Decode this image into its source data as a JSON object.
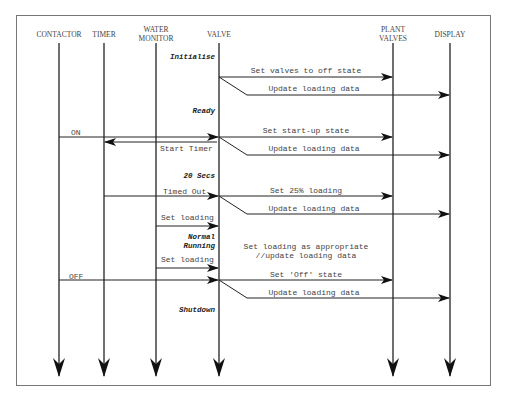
{
  "diagram": {
    "type": "sequence-diagram",
    "lifelines": [
      {
        "id": "contactor",
        "label": "CONTACTOR",
        "x": 59
      },
      {
        "id": "timer",
        "label": "TIMER",
        "x": 104
      },
      {
        "id": "water_monitor",
        "label": "WATER\nMONITOR",
        "label_line1": "WATER",
        "label_line2": "MONITOR",
        "x": 156
      },
      {
        "id": "valve",
        "label": "VALVE",
        "x": 219
      },
      {
        "id": "plant_valves",
        "label": "PLANT\nVALVES",
        "label_line1": "PLANT",
        "label_line2": "VALVES",
        "x": 393
      },
      {
        "id": "display",
        "label": "DISPLAY",
        "x": 450
      }
    ],
    "states": [
      {
        "label": "Initialise"
      },
      {
        "label": "Ready"
      },
      {
        "label": "20 Secs"
      },
      {
        "label": "Normal",
        "label2": "Running"
      },
      {
        "label": "Shutdown"
      }
    ],
    "messages": [
      {
        "label": "Set valves to off state",
        "from": "VALVE",
        "to": "PLANT VALVES"
      },
      {
        "label": "Update loading data",
        "from": "VALVE",
        "to": "DISPLAY"
      },
      {
        "label": "ON",
        "from": "CONTACTOR",
        "to": "VALVE"
      },
      {
        "label": "Set start-up state",
        "from": "VALVE",
        "to": "PLANT VALVES"
      },
      {
        "label": "Start Timer",
        "from": "VALVE",
        "to": "TIMER"
      },
      {
        "label": "Update loading data",
        "from": "VALVE",
        "to": "DISPLAY"
      },
      {
        "label": "Timed Out",
        "from": "TIMER",
        "to": "VALVE"
      },
      {
        "label": "Set 25% loading",
        "from": "VALVE",
        "to": "PLANT VALVES"
      },
      {
        "label": "Update loading data",
        "from": "VALVE",
        "to": "DISPLAY"
      },
      {
        "label": "Set loading",
        "from": "WATER MONITOR",
        "to": "VALVE"
      },
      {
        "label": "Set loading",
        "from": "WATER MONITOR",
        "to": "VALVE"
      },
      {
        "label": "OFF",
        "from": "CONTACTOR",
        "to": "VALVE"
      },
      {
        "label": "Set 'Off' state",
        "from": "VALVE",
        "to": "PLANT VALVES"
      },
      {
        "label": "Update loading data",
        "from": "VALVE",
        "to": "DISPLAY"
      }
    ],
    "notes": [
      {
        "line1": "Set loading as appropriate",
        "line2": "//update loading data"
      }
    ]
  }
}
